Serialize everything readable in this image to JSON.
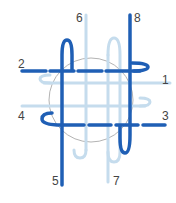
{
  "diagram": {
    "type": "knot-weave",
    "colors": {
      "dark": "#1f5fb5",
      "light": "#c5dced",
      "circle": "#999999"
    },
    "labels": [
      {
        "id": "1",
        "text": "1"
      },
      {
        "id": "2",
        "text": "2"
      },
      {
        "id": "3",
        "text": "3"
      },
      {
        "id": "4",
        "text": "4"
      },
      {
        "id": "5",
        "text": "5"
      },
      {
        "id": "6",
        "text": "6"
      },
      {
        "id": "7",
        "text": "7"
      },
      {
        "id": "8",
        "text": "8"
      }
    ]
  }
}
